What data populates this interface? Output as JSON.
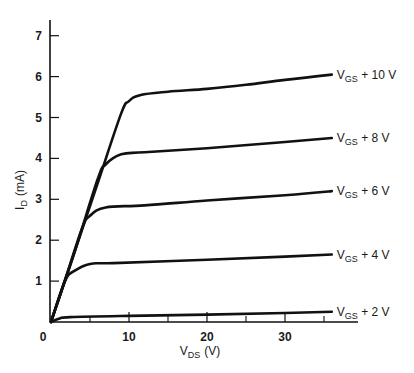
{
  "chart_data": {
    "type": "line",
    "title": "",
    "xlabel": "V_DS (V)",
    "ylabel": "I_D (mA)",
    "xlabel_main": "V",
    "xlabel_sub": "DS",
    "xlabel_unit": "(V)",
    "ylabel_main": "I",
    "ylabel_sub": "D",
    "ylabel_unit": "(mA)",
    "xlim": [
      0,
      37
    ],
    "ylim": [
      0,
      7.5
    ],
    "grid": false,
    "legend": "inline labels at right end of each curve",
    "x_ticks": [
      0,
      10,
      20,
      30
    ],
    "x_tick_labels": [
      "0",
      "10",
      "20",
      "30"
    ],
    "x_minor_ticks": [
      5,
      15,
      25,
      35
    ],
    "y_ticks": [
      1,
      2,
      3,
      4,
      5,
      6,
      7
    ],
    "y_tick_labels": [
      "1",
      "2",
      "3",
      "4",
      "5",
      "6",
      "7"
    ],
    "series": [
      {
        "name": "V_GS + 10 V",
        "label_main": "V",
        "label_sub": "GS",
        "label_rest": " + 10 V",
        "x": [
          0,
          3,
          6,
          9,
          10,
          11.5,
          15,
          20,
          25,
          30,
          36
        ],
        "y": [
          0,
          1.7,
          3.4,
          5.1,
          5.4,
          5.55,
          5.63,
          5.7,
          5.8,
          5.92,
          6.05
        ]
      },
      {
        "name": "V_GS + 8 V",
        "label_main": "V",
        "label_sub": "GS",
        "label_rest": " + 8 V",
        "x": [
          0,
          3,
          6,
          7,
          9,
          12,
          20,
          30,
          36
        ],
        "y": [
          0,
          1.7,
          3.5,
          3.85,
          4.1,
          4.15,
          4.25,
          4.4,
          4.5
        ]
      },
      {
        "name": "V_GS + 6 V",
        "label_main": "V",
        "label_sub": "GS",
        "label_rest": " + 6 V",
        "x": [
          0,
          2,
          4,
          5,
          7,
          12,
          20,
          30,
          36
        ],
        "y": [
          0,
          1.15,
          2.3,
          2.6,
          2.8,
          2.85,
          2.97,
          3.1,
          3.2
        ]
      },
      {
        "name": "V_GS + 4 V",
        "label_main": "V",
        "label_sub": "GS",
        "label_rest": " + 4 V",
        "x": [
          0,
          1.8,
          3,
          5,
          8,
          20,
          30,
          36
        ],
        "y": [
          0,
          1.0,
          1.25,
          1.42,
          1.44,
          1.52,
          1.6,
          1.65
        ]
      },
      {
        "name": "V_GS + 2 V",
        "label_main": "V",
        "label_sub": "GS",
        "label_rest": " + 2 V",
        "x": [
          0,
          1,
          2.5,
          10,
          20,
          30,
          36
        ],
        "y": [
          0,
          0.08,
          0.12,
          0.15,
          0.18,
          0.22,
          0.25
        ]
      }
    ]
  },
  "layout": {
    "x_origin_px": 51,
    "y_origin_px": 322,
    "px_per_x": 7.8,
    "px_per_y": 40.9,
    "axis_top_px": 20,
    "axis_right_px": 358,
    "line_color": "#111111"
  }
}
